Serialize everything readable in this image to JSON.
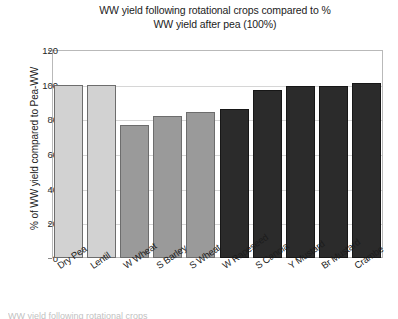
{
  "chart_data": {
    "type": "bar",
    "title": "WW yield following rotational crops compared to % WW yield after pea (100%)",
    "title_line1": "WW yield following rotational crops compared to %",
    "title_line2": "WW yield after pea (100%)",
    "xlabel": "",
    "ylabel": "% of WW yield compared to Pea-WW",
    "ylim": [
      0,
      120
    ],
    "ytick_labels": [
      "0",
      "20",
      "40",
      "60",
      "80",
      "100",
      "120"
    ],
    "ytick_values": [
      0,
      20,
      40,
      60,
      80,
      100,
      120
    ],
    "grid": true,
    "legend": "none",
    "categories": [
      "Dry Pea",
      "Lentil",
      "W Wheat",
      "S Barley",
      "S Wheat",
      "W Rapeseed",
      "S Canola",
      "Y Mustard",
      "Br Mustard",
      "Crambe"
    ],
    "values": [
      100,
      100,
      77,
      82,
      84,
      86,
      97,
      99,
      99,
      101
    ],
    "bar_colors": [
      "#d2d2d2",
      "#d2d2d2",
      "#9a9a9a",
      "#9a9a9a",
      "#9a9a9a",
      "#2b2b2b",
      "#2b2b2b",
      "#2b2b2b",
      "#2b2b2b",
      "#2b2b2b"
    ]
  },
  "caption": {
    "cut_text": "WW yield following rotational crops"
  }
}
